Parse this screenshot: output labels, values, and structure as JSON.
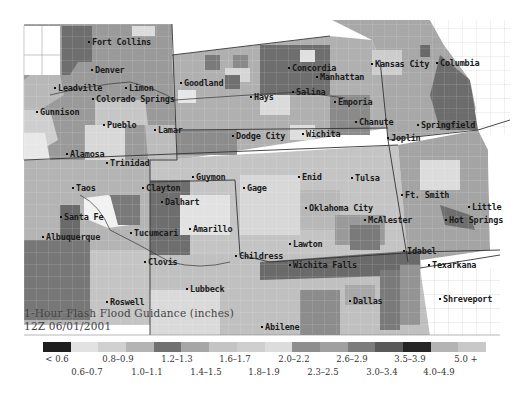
{
  "map": {
    "title": "1-Hour Flash Flood Guidance (inches)",
    "timestamp": "12Z 06/01/2001",
    "region": "Central Plains",
    "cities": [
      {
        "name": "Fort Collins",
        "x": 92,
        "y": 43
      },
      {
        "name": "Denver",
        "x": 95,
        "y": 71
      },
      {
        "name": "Leadville",
        "x": 58,
        "y": 89
      },
      {
        "name": "Limon",
        "x": 129,
        "y": 89
      },
      {
        "name": "Colorado Springs",
        "x": 96,
        "y": 100
      },
      {
        "name": "Gunnison",
        "x": 40,
        "y": 113
      },
      {
        "name": "Pueblo",
        "x": 107,
        "y": 126
      },
      {
        "name": "Lamar",
        "x": 158,
        "y": 131
      },
      {
        "name": "Alamosa",
        "x": 70,
        "y": 155
      },
      {
        "name": "Trinidad",
        "x": 110,
        "y": 164
      },
      {
        "name": "Goodland",
        "x": 184,
        "y": 84
      },
      {
        "name": "Hays",
        "x": 254,
        "y": 98
      },
      {
        "name": "Concordia",
        "x": 292,
        "y": 69
      },
      {
        "name": "Manhattan",
        "x": 320,
        "y": 78
      },
      {
        "name": "Salina",
        "x": 296,
        "y": 93
      },
      {
        "name": "Emporia",
        "x": 338,
        "y": 103
      },
      {
        "name": "Dodge City",
        "x": 236,
        "y": 137
      },
      {
        "name": "Wichita",
        "x": 306,
        "y": 135
      },
      {
        "name": "Kansas City",
        "x": 375,
        "y": 65
      },
      {
        "name": "Columbia",
        "x": 440,
        "y": 64
      },
      {
        "name": "Chanute",
        "x": 359,
        "y": 123
      },
      {
        "name": "Springfield",
        "x": 421,
        "y": 126
      },
      {
        "name": "Joplin",
        "x": 391,
        "y": 139
      },
      {
        "name": "Taos",
        "x": 76,
        "y": 189
      },
      {
        "name": "Clayton",
        "x": 146,
        "y": 189
      },
      {
        "name": "Guymon",
        "x": 196,
        "y": 178
      },
      {
        "name": "Gage",
        "x": 247,
        "y": 189
      },
      {
        "name": "Enid",
        "x": 302,
        "y": 178
      },
      {
        "name": "Tulsa",
        "x": 355,
        "y": 179
      },
      {
        "name": "Dalhart",
        "x": 165,
        "y": 203
      },
      {
        "name": "Santa Fe",
        "x": 64,
        "y": 218
      },
      {
        "name": "Ft. Smith",
        "x": 405,
        "y": 196
      },
      {
        "name": "Oklahoma City",
        "x": 309,
        "y": 209
      },
      {
        "name": "Little",
        "x": 472,
        "y": 208
      },
      {
        "name": "Albuquerque",
        "x": 46,
        "y": 238
      },
      {
        "name": "Amarillo",
        "x": 193,
        "y": 230
      },
      {
        "name": "Tucumcari",
        "x": 134,
        "y": 234
      },
      {
        "name": "McAlester",
        "x": 368,
        "y": 221
      },
      {
        "name": "Hot Springs",
        "x": 449,
        "y": 221
      },
      {
        "name": "Lawton",
        "x": 293,
        "y": 245
      },
      {
        "name": "Clovis",
        "x": 148,
        "y": 263
      },
      {
        "name": "Childress",
        "x": 239,
        "y": 257
      },
      {
        "name": "Idabel",
        "x": 407,
        "y": 252
      },
      {
        "name": "Wichita Falls",
        "x": 293,
        "y": 266
      },
      {
        "name": "Texarkana",
        "x": 432,
        "y": 266
      },
      {
        "name": "Lubbeck",
        "x": 190,
        "y": 290
      },
      {
        "name": "Roswell",
        "x": 110,
        "y": 303
      },
      {
        "name": "Dallas",
        "x": 353,
        "y": 302
      },
      {
        "name": "Shreveport",
        "x": 443,
        "y": 300
      },
      {
        "name": "Abilene",
        "x": 265,
        "y": 328
      }
    ]
  },
  "legend": {
    "colors": [
      "#1e1e1e",
      "#e2e2e2",
      "#d0d0d0",
      "#b4b4b4",
      "#717171",
      "#a6a6a6",
      "#c4c4c4",
      "#cfcfcf",
      "#dcdcdc",
      "#8e8e8e",
      "#a0a0a0",
      "#7c7c7c",
      "#5a5a5a",
      "#262626",
      "#b4b4b4",
      "#c8c8c8"
    ],
    "top_labels": [
      {
        "text": "< 0.6",
        "x": 57
      },
      {
        "text": "0.8–0.9",
        "x": 118
      },
      {
        "text": "1.2–1.3",
        "x": 177
      },
      {
        "text": "1.6–1.7",
        "x": 235
      },
      {
        "text": "2.0–2.2",
        "x": 294
      },
      {
        "text": "2.6–2.9",
        "x": 352
      },
      {
        "text": "3.5–3.9",
        "x": 410
      },
      {
        "text": "5.0 +",
        "x": 466
      }
    ],
    "bottom_labels": [
      {
        "text": "0.6–0.7",
        "x": 87
      },
      {
        "text": "1.0–1.1",
        "x": 147
      },
      {
        "text": "1.4–1.5",
        "x": 206
      },
      {
        "text": "1.8–1.9",
        "x": 264
      },
      {
        "text": "2.3–2.5",
        "x": 323
      },
      {
        "text": "3.0–3.4",
        "x": 382
      },
      {
        "text": "4.0–4.9",
        "x": 439
      }
    ]
  }
}
